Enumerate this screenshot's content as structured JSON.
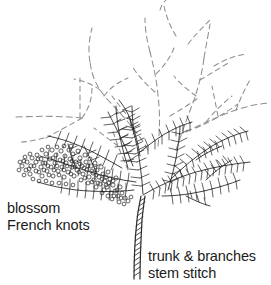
{
  "diagram": {
    "background_color": "#ffffff",
    "ink_color": "#1b1b1b",
    "dashed_branch_color": "#8f8f8f",
    "width": 271,
    "height": 285
  },
  "labels": {
    "blossom": {
      "line1": "blossom",
      "line2": "French knots",
      "stitch_name": "French knots",
      "element_name": "blossom"
    },
    "trunk": {
      "line1": "trunk & branches",
      "line2": "stem stitch",
      "stitch_name": "stem stitch",
      "element_name": "trunk & branches"
    }
  },
  "drawing": {
    "trunk": {
      "name": "trunk",
      "style": "stem-stitch",
      "base_x": 137,
      "base_y": 278,
      "top_x": 141,
      "top_y": 196
    },
    "foliage_name": "feathery-foliage",
    "blossom_cluster_name": "french-knot-blossom-cluster",
    "dashed_branches_name": "dashed-guide-branches",
    "knot_count": 186
  }
}
